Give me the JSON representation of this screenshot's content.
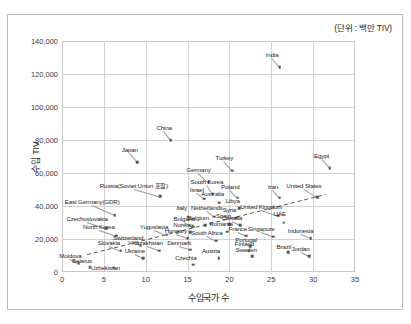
{
  "unit_note": "(단위 : 백만 TIV)",
  "chart_data": {
    "type": "scatter",
    "title": "",
    "xlabel": "수입국가 수",
    "ylabel": "수입 TIV",
    "unit_note": "(단위 : 백만 TIV)",
    "xlim": [
      0,
      35
    ],
    "ylim": [
      0,
      140000
    ],
    "xticks": [
      "0",
      "5",
      "10",
      "15",
      "20",
      "25",
      "30",
      "35"
    ],
    "xtick_values": [
      0,
      5,
      10,
      15,
      20,
      25,
      30,
      35
    ],
    "yticks": [
      "0",
      "20,000",
      "40,000",
      "60,000",
      "80,000",
      "100,000",
      "120,000",
      "140,000"
    ],
    "ytick_values": [
      0,
      20000,
      40000,
      60000,
      80000,
      100000,
      120000,
      140000
    ],
    "grid": true,
    "legend": "none",
    "marker_color": "#555555",
    "trendline": {
      "style": "dashed",
      "color": "#555555",
      "x0": 3.0,
      "y0": 10500,
      "x1": 31.5,
      "y1": 47000
    },
    "points": [
      {
        "label": "India",
        "x": 26.0,
        "y": 124000,
        "lx": 25.1,
        "ly": 129500
      },
      {
        "label": "Egypt",
        "x": 32.0,
        "y": 63000,
        "lx": 31.0,
        "ly": 68500
      },
      {
        "label": "China",
        "x": 13.0,
        "y": 80000,
        "lx": 12.2,
        "ly": 85500
      },
      {
        "label": "Japan",
        "x": 9.0,
        "y": 66500,
        "lx": 8.1,
        "ly": 72000
      },
      {
        "label": "Turkey",
        "x": 20.3,
        "y": 61500,
        "lx": 19.4,
        "ly": 67000
      },
      {
        "label": "Germany",
        "x": 17.5,
        "y": 54500,
        "lx": 16.3,
        "ly": 60000
      },
      {
        "label": "South Korea",
        "x": 18.0,
        "y": 47500,
        "lx": 17.3,
        "ly": 53000
      },
      {
        "label": "Russia(Soviet Union 포함)",
        "x": 11.7,
        "y": 46000,
        "lx": 8.6,
        "ly": 50500
      },
      {
        "label": "Israel",
        "x": 17.0,
        "y": 44500,
        "lx": 16.1,
        "ly": 48000
      },
      {
        "label": "Poland",
        "x": 21.0,
        "y": 45000,
        "lx": 20.1,
        "ly": 50000
      },
      {
        "label": "Iran",
        "x": 26.0,
        "y": 45000,
        "lx": 25.2,
        "ly": 50000
      },
      {
        "label": "United States",
        "x": 30.5,
        "y": 45500,
        "lx": 28.9,
        "ly": 50500
      },
      {
        "label": "East Germany(GDR)",
        "x": 6.3,
        "y": 34500,
        "lx": 3.6,
        "ly": 40500
      },
      {
        "label": "Australia",
        "x": 18.8,
        "y": 42000,
        "lx": 18.0,
        "ly": 45500
      },
      {
        "label": "Italy",
        "x": 15.0,
        "y": 33500,
        "lx": 14.3,
        "ly": 37000
      },
      {
        "label": "Netherlands",
        "x": 18.2,
        "y": 33500,
        "lx": 17.3,
        "ly": 37000
      },
      {
        "label": "Libya",
        "x": 21.2,
        "y": 38500,
        "lx": 20.4,
        "ly": 41500
      },
      {
        "label": "Syria",
        "x": 20.8,
        "y": 33000,
        "lx": 20.0,
        "ly": 36000
      },
      {
        "label": "United Kingdom",
        "x": 25.8,
        "y": 34000,
        "lx": 23.8,
        "ly": 37500
      },
      {
        "label": "UAE",
        "x": 26.5,
        "y": 30000,
        "lx": 26.0,
        "ly": 33500
      },
      {
        "label": "Czechoslovakia",
        "x": 5.3,
        "y": 26500,
        "lx": 3.0,
        "ly": 30500
      },
      {
        "label": "Spain",
        "x": 20.0,
        "y": 29000,
        "lx": 19.3,
        "ly": 32000
      },
      {
        "label": "Canada",
        "x": 21.3,
        "y": 28500,
        "lx": 20.3,
        "ly": 31000
      },
      {
        "label": "Belgium",
        "x": 17.1,
        "y": 28500,
        "lx": 16.3,
        "ly": 31000
      },
      {
        "label": "Bulgaria",
        "x": 15.7,
        "y": 27500,
        "lx": 14.6,
        "ly": 30500
      },
      {
        "label": "North Korea",
        "x": 6.5,
        "y": 22000,
        "lx": 4.4,
        "ly": 25500
      },
      {
        "label": "Yugoslavia",
        "x": 12.5,
        "y": 22500,
        "lx": 11.0,
        "ly": 25500
      },
      {
        "label": "Norway",
        "x": 15.3,
        "y": 24000,
        "lx": 14.5,
        "ly": 26500
      },
      {
        "label": "Romania",
        "x": 19.7,
        "y": 24500,
        "lx": 19.0,
        "ly": 27000
      },
      {
        "label": "France",
        "x": 22.0,
        "y": 22000,
        "lx": 21.0,
        "ly": 24500
      },
      {
        "label": "Singapore",
        "x": 25.2,
        "y": 21500,
        "lx": 23.8,
        "ly": 24000
      },
      {
        "label": "Indonesia",
        "x": 29.7,
        "y": 20500,
        "lx": 28.5,
        "ly": 23000
      },
      {
        "label": "Hungary",
        "x": 15.0,
        "y": 20500,
        "lx": 13.6,
        "ly": 23000
      },
      {
        "label": "South Africa",
        "x": 18.4,
        "y": 19000,
        "lx": 17.3,
        "ly": 22000
      },
      {
        "label": "Switzerland",
        "x": 9.4,
        "y": 16000,
        "lx": 7.9,
        "ly": 18500
      },
      {
        "label": "Slovakia",
        "x": 7.0,
        "y": 13000,
        "lx": 5.6,
        "ly": 16000
      },
      {
        "label": "Kazakhstan",
        "x": 11.6,
        "y": 13000,
        "lx": 10.2,
        "ly": 15500
      },
      {
        "label": "Denmark",
        "x": 15.3,
        "y": 13500,
        "lx": 14.0,
        "ly": 15500
      },
      {
        "label": "Portugal",
        "x": 22.5,
        "y": 15500,
        "lx": 22.0,
        "ly": 17500
      },
      {
        "label": "Finland",
        "x": 22.3,
        "y": 13000,
        "lx": 21.8,
        "ly": 15000
      },
      {
        "label": "Brazil",
        "x": 27.0,
        "y": 12000,
        "lx": 26.5,
        "ly": 13500
      },
      {
        "label": "Sweden",
        "x": 22.7,
        "y": 9500,
        "lx": 22.0,
        "ly": 11500
      },
      {
        "label": "Jordan",
        "x": 29.5,
        "y": 9500,
        "lx": 28.5,
        "ly": 12000
      },
      {
        "label": "Ukraine",
        "x": 9.7,
        "y": 8500,
        "lx": 8.7,
        "ly": 11000
      },
      {
        "label": "Austria",
        "x": 18.7,
        "y": 8500,
        "lx": 17.8,
        "ly": 11000
      },
      {
        "label": "Moldova",
        "x": 2.0,
        "y": 5500,
        "lx": 1.0,
        "ly": 8000
      },
      {
        "label": "Czechia",
        "x": 15.7,
        "y": 4500,
        "lx": 14.8,
        "ly": 6500
      },
      {
        "label": "Belarus",
        "x": 3.3,
        "y": 3000,
        "lx": 2.4,
        "ly": 5000
      },
      {
        "label": "Uzbekistan",
        "x": 6.2,
        "y": 2500,
        "lx": 5.2,
        "ly": 500
      }
    ]
  }
}
